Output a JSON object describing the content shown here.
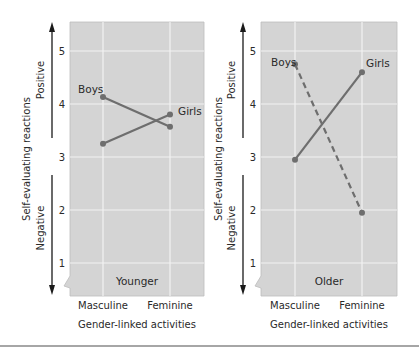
{
  "chart_data": [
    {
      "type": "line",
      "panel_label": "Younger",
      "title": "",
      "xlabel": "Gender-linked activities",
      "ylabel": "Self-evaluating reactions",
      "y_direction_labels": {
        "up": "Positive",
        "down": "Negative"
      },
      "categories": [
        "Masculine",
        "Feminine"
      ],
      "yticks": [
        "1",
        "2",
        "3",
        "4",
        "5"
      ],
      "ylim": [
        0.4,
        5.6
      ],
      "grid": true,
      "series": [
        {
          "name": "Boys",
          "values": [
            4.13,
            3.57
          ],
          "style": "solid"
        },
        {
          "name": "Girls",
          "values": [
            3.25,
            3.8
          ],
          "style": "solid"
        }
      ]
    },
    {
      "type": "line",
      "panel_label": "Older",
      "title": "",
      "xlabel": "Gender-linked activities",
      "ylabel": "Self-evaluating reactions",
      "y_direction_labels": {
        "up": "Positive",
        "down": "Negative"
      },
      "categories": [
        "Masculine",
        "Feminine"
      ],
      "yticks": [
        "1",
        "2",
        "3",
        "4",
        "5"
      ],
      "ylim": [
        0.4,
        5.6
      ],
      "grid": true,
      "series": [
        {
          "name": "Boys",
          "values": [
            4.75,
            1.95
          ],
          "style": "dashed"
        },
        {
          "name": "Girls",
          "values": [
            2.95,
            4.6
          ],
          "style": "solid"
        }
      ]
    }
  ],
  "colors": {
    "plot_bg": "#d4d4d4",
    "grid": "#f2f2f2",
    "line": "#6e6e6e",
    "axis_arrow": "#1a1a1a",
    "rule": "#888888"
  }
}
